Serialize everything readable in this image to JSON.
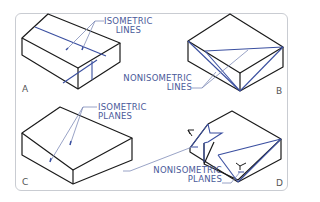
{
  "figure": {
    "panels": [
      {
        "letter": "A",
        "label_lines": [
          "ISOMETRIC",
          "LINES"
        ]
      },
      {
        "letter": "B",
        "label_lines": [
          "NONISOMETRIC",
          "LINES"
        ]
      },
      {
        "letter": "C",
        "label_lines": [
          "ISOMETRIC",
          "PLANES"
        ]
      },
      {
        "letter": "D",
        "label_lines": [
          "NONISOMETRIC",
          "PLANES"
        ]
      }
    ]
  },
  "colors": {
    "outline": "#1a1a1a",
    "highlight": "#3a4fa0",
    "leader": "#7f8cb8",
    "label": "#4a5a9a",
    "frame": "#c9ccd2"
  }
}
